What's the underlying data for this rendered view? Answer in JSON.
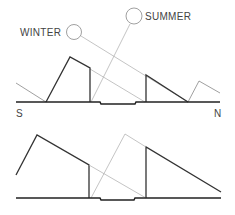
{
  "diagram": {
    "top": {
      "labels": {
        "winter": "WINTER",
        "summer": "SUMMER",
        "south": "S",
        "north": "N"
      }
    },
    "bottom": {}
  }
}
